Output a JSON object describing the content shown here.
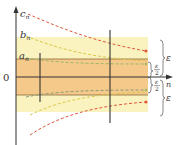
{
  "diagram": {
    "labels": {
      "c_seq": "c",
      "c_sub": "n",
      "b_seq": "b",
      "b_sub": "n",
      "a_seq": "a",
      "a_sub": "n",
      "origin": "0",
      "x_axis": "n",
      "eps_top": "ε",
      "eps_bottom": "ε",
      "half_eps_num": "ε",
      "half_eps_den": "2"
    },
    "colors": {
      "outer_band": "#fbf3bf",
      "inner_band": "#f5c98a",
      "c_curve": "#e0593f",
      "b_curve": "#e2d35a",
      "a_curve": "#9ab86a",
      "axis": "#333333"
    }
  }
}
